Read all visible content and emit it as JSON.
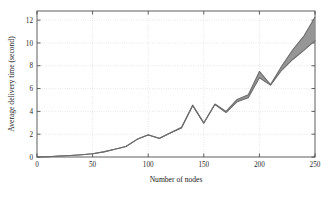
{
  "figure": {
    "background_color": "#ffffff",
    "axis_color": "#4d4d4d",
    "grid_color": "#c9c9c9",
    "series_color": "#6b6b6b",
    "band_color": "#8d8d8d"
  },
  "axes": {
    "x_title": "Number of nodes",
    "y_title": "Average delivery time (second)",
    "x_ticks": [
      "0",
      "50",
      "100",
      "150",
      "200",
      "250"
    ],
    "y_ticks": [
      "0",
      "2",
      "4",
      "6",
      "8",
      "10",
      "12"
    ]
  },
  "chart_data": {
    "type": "line",
    "title": "",
    "subtitle": "",
    "xlabel": "Number of nodes",
    "ylabel": "Average delivery time (second)",
    "xlim": [
      0,
      250
    ],
    "ylim": [
      0,
      12.8
    ],
    "xticks": [
      0,
      50,
      100,
      150,
      200,
      250
    ],
    "yticks": [
      0,
      2,
      4,
      6,
      8,
      10,
      12
    ],
    "grid": true,
    "legend": null,
    "legend_position": "none",
    "annotations": [],
    "x": [
      0,
      10,
      20,
      30,
      40,
      50,
      60,
      70,
      80,
      90,
      100,
      110,
      120,
      130,
      140,
      150,
      160,
      170,
      180,
      190,
      200,
      210,
      220,
      230,
      240,
      250
    ],
    "series": [
      {
        "name": "lower bound",
        "values": [
          0.0,
          0.03,
          0.08,
          0.14,
          0.2,
          0.28,
          0.45,
          0.68,
          0.92,
          1.55,
          1.92,
          1.62,
          2.1,
          2.55,
          4.5,
          2.95,
          4.6,
          3.9,
          4.85,
          5.2,
          6.95,
          6.3,
          7.6,
          8.55,
          9.35,
          10.2
        ]
      },
      {
        "name": "upper bound",
        "values": [
          0.0,
          0.03,
          0.08,
          0.14,
          0.2,
          0.28,
          0.45,
          0.68,
          0.92,
          1.55,
          1.95,
          1.65,
          2.12,
          2.6,
          4.55,
          3.0,
          4.65,
          4.0,
          5.05,
          5.45,
          7.5,
          6.35,
          7.95,
          9.4,
          10.6,
          12.25
        ]
      }
    ]
  }
}
